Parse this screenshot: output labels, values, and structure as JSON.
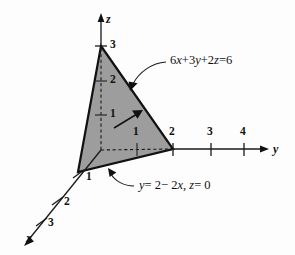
{
  "figure": {
    "type": "3d-coordinate-diagram",
    "background_color": "#fdfdfd",
    "plane_fill_color": "#9d9d9d",
    "line_color": "#111111",
    "axes": {
      "z": {
        "name": "z",
        "ticks": [
          "1",
          "2",
          "3"
        ]
      },
      "y": {
        "name": "y",
        "ticks": [
          "1",
          "2",
          "3",
          "4"
        ]
      },
      "x": {
        "name": "x",
        "ticks": [
          "1",
          "2",
          "3"
        ]
      }
    },
    "annotations": {
      "plane_equation": "6x + 3y + 2z = 6",
      "plane_equation_parts": {
        "a": "6",
        "x": "x",
        "plus1": "+",
        "b": "3",
        "y": "y",
        "plus2": "+",
        "c": "2",
        "z": "z",
        "equals": "=",
        "rhs": "6"
      },
      "base_line_equation": "y = 2 - 2x, z = 0",
      "base_line_parts": {
        "y": "y",
        "eq1": "= 2",
        "minus": "− 2",
        "x": "x",
        "comma": ",",
        "z": "z",
        "eq2": "= 0"
      },
      "normal_vector_arrow": "normal-vector-arrow"
    },
    "vertices": {
      "x_intercept_label": "1",
      "y_intercept_label": "2",
      "z_intercept_label": "3"
    }
  }
}
